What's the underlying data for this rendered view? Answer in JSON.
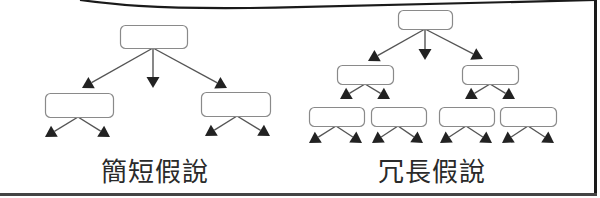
{
  "panel": {
    "border_color": "#1a1a1a",
    "line_color": "#555555",
    "arrow_color": "#222222",
    "box_stroke": "#8a8a8a"
  },
  "diagrams": [
    {
      "id": "short",
      "label": "簡短假說",
      "label_x": 155,
      "boxes": [
        {
          "x": 120,
          "y": 25,
          "w": 67,
          "h": 23
        },
        {
          "x": 45,
          "y": 93,
          "w": 68,
          "h": 24
        },
        {
          "x": 201,
          "y": 92,
          "w": 69,
          "h": 24
        }
      ],
      "arrows": [
        {
          "x1": 153,
          "y1": 48,
          "x2": 82,
          "y2": 88
        },
        {
          "x1": 153,
          "y1": 48,
          "x2": 153,
          "y2": 88
        },
        {
          "x1": 153,
          "y1": 48,
          "x2": 227,
          "y2": 88
        },
        {
          "x1": 78,
          "y1": 117,
          "x2": 45,
          "y2": 137
        },
        {
          "x1": 78,
          "y1": 117,
          "x2": 110,
          "y2": 137
        },
        {
          "x1": 237,
          "y1": 116,
          "x2": 205,
          "y2": 136
        },
        {
          "x1": 237,
          "y1": 116,
          "x2": 270,
          "y2": 136
        }
      ]
    },
    {
      "id": "long",
      "label": "冗長假說",
      "label_x": 432,
      "boxes": [
        {
          "x": 398,
          "y": 10,
          "w": 54,
          "h": 19
        },
        {
          "x": 337,
          "y": 65,
          "w": 56,
          "h": 19
        },
        {
          "x": 462,
          "y": 65,
          "w": 56,
          "h": 19
        },
        {
          "x": 309,
          "y": 107,
          "w": 55,
          "h": 19
        },
        {
          "x": 371,
          "y": 107,
          "w": 55,
          "h": 19
        },
        {
          "x": 439,
          "y": 107,
          "w": 55,
          "h": 19
        },
        {
          "x": 500,
          "y": 107,
          "w": 56,
          "h": 19
        }
      ],
      "arrows": [
        {
          "x1": 425,
          "y1": 29,
          "x2": 368,
          "y2": 61
        },
        {
          "x1": 425,
          "y1": 29,
          "x2": 425,
          "y2": 60
        },
        {
          "x1": 425,
          "y1": 29,
          "x2": 483,
          "y2": 59
        },
        {
          "x1": 365,
          "y1": 84,
          "x2": 340,
          "y2": 99
        },
        {
          "x1": 365,
          "y1": 84,
          "x2": 390,
          "y2": 99
        },
        {
          "x1": 490,
          "y1": 84,
          "x2": 465,
          "y2": 99
        },
        {
          "x1": 490,
          "y1": 84,
          "x2": 515,
          "y2": 99
        },
        {
          "x1": 336,
          "y1": 126,
          "x2": 309,
          "y2": 143
        },
        {
          "x1": 336,
          "y1": 126,
          "x2": 362,
          "y2": 143
        },
        {
          "x1": 398,
          "y1": 126,
          "x2": 372,
          "y2": 143
        },
        {
          "x1": 398,
          "y1": 126,
          "x2": 423,
          "y2": 143
        },
        {
          "x1": 466,
          "y1": 126,
          "x2": 440,
          "y2": 143
        },
        {
          "x1": 466,
          "y1": 126,
          "x2": 492,
          "y2": 143
        },
        {
          "x1": 528,
          "y1": 126,
          "x2": 502,
          "y2": 143
        },
        {
          "x1": 528,
          "y1": 126,
          "x2": 554,
          "y2": 143
        }
      ]
    }
  ]
}
